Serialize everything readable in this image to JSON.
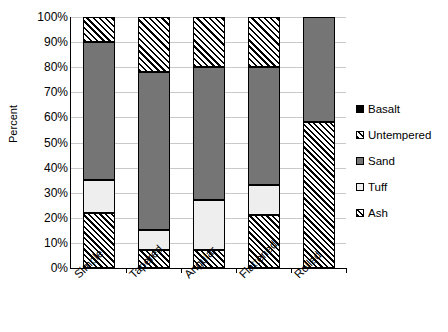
{
  "chart_data": {
    "type": "bar",
    "subtype": "stacked-percent-column",
    "title": "",
    "xlabel": "",
    "ylabel": "Percent",
    "categories": [
      "Simple",
      "Tapered",
      "Angular",
      "Flattened",
      "Rolled"
    ],
    "series": [
      {
        "name": "Ash",
        "values": [
          22,
          7,
          7,
          21,
          58
        ]
      },
      {
        "name": "Tuff",
        "values": [
          13,
          8,
          20,
          12,
          0
        ]
      },
      {
        "name": "Sand",
        "values": [
          55,
          63,
          53,
          47,
          42
        ]
      },
      {
        "name": "Untempered",
        "values": [
          10,
          22,
          20,
          20,
          0
        ]
      },
      {
        "name": "Basalt",
        "values": [
          0,
          0,
          0,
          0,
          0
        ]
      }
    ],
    "stack_order": [
      "Ash",
      "Tuff",
      "Sand",
      "Untempered",
      "Basalt"
    ],
    "ylim": [
      0,
      100
    ],
    "ytick_values": [
      0,
      10,
      20,
      30,
      40,
      50,
      60,
      70,
      80,
      90,
      100
    ],
    "ytick_labels": [
      "0%",
      "10%",
      "20%",
      "30%",
      "40%",
      "50%",
      "60%",
      "70%",
      "80%",
      "90%",
      "100%"
    ],
    "grid": true,
    "grid_axis": "y",
    "legend_position": "right",
    "legend_entries": [
      {
        "label": "Basalt",
        "pattern": "solid-black",
        "color": "#000000"
      },
      {
        "label": "Untempered",
        "pattern": "diagonal-hatch",
        "color": "#ffffff"
      },
      {
        "label": "Sand",
        "pattern": "solid-gray",
        "color": "#757575"
      },
      {
        "label": "Tuff",
        "pattern": "solid-white",
        "color": "#eeeeee"
      },
      {
        "label": "Ash",
        "pattern": "diagonal-hatch",
        "color": "#ffffff"
      }
    ],
    "colors": {
      "ash": "#ffffff",
      "tuff": "#eeeeee",
      "sand": "#757575",
      "untempered": "#ffffff",
      "basalt": "#000000",
      "gridline": "#c9c9c9",
      "axis": "#000000"
    }
  },
  "axis": {
    "y_title": "Percent",
    "y_ticks": [
      "100%",
      "90%",
      "80%",
      "70%",
      "60%",
      "50%",
      "40%",
      "30%",
      "20%",
      "10%",
      "0%"
    ],
    "x_ticks": [
      "Simple",
      "Tapered",
      "Angular",
      "Flattened",
      "Rolled"
    ]
  },
  "legend": {
    "items": [
      {
        "label": "Basalt"
      },
      {
        "label": "Untempered"
      },
      {
        "label": "Sand"
      },
      {
        "label": "Tuff"
      },
      {
        "label": "Ash"
      }
    ]
  }
}
